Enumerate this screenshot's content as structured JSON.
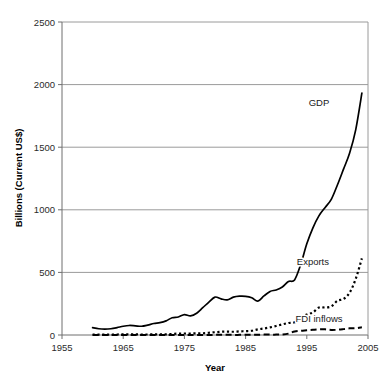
{
  "chart_data": {
    "type": "line",
    "title": "",
    "xlabel": "Year",
    "ylabel": "Billions (Current US$)",
    "xlim": [
      1955,
      2005
    ],
    "ylim": [
      0,
      2500
    ],
    "xticks": [
      "1955",
      "1965",
      "1975",
      "1985",
      "1995",
      "2005"
    ],
    "xtick_values": [
      1955,
      1965,
      1975,
      1985,
      1995,
      2005
    ],
    "yticks": [
      "0",
      "500",
      "1000",
      "1500",
      "2000",
      "2500"
    ],
    "ytick_values": [
      0,
      500,
      1000,
      1500,
      2000,
      2500
    ],
    "grid": "horizontal",
    "legend_position": "inline-annotations",
    "x": [
      1960,
      1961,
      1962,
      1963,
      1964,
      1965,
      1966,
      1967,
      1968,
      1969,
      1970,
      1971,
      1972,
      1973,
      1974,
      1975,
      1976,
      1977,
      1978,
      1979,
      1980,
      1981,
      1982,
      1983,
      1984,
      1985,
      1986,
      1987,
      1988,
      1989,
      1990,
      1991,
      1992,
      1993,
      1994,
      1995,
      1996,
      1997,
      1998,
      1999,
      2000,
      2001,
      2002,
      2003,
      2004
    ],
    "series": [
      {
        "name": "GDP",
        "style": "solid",
        "color": "#000000",
        "label_x": 1997,
        "label_y": 1830,
        "values": [
          59,
          50,
          47,
          50,
          59,
          70,
          76,
          73,
          70,
          79,
          92,
          99,
          113,
          138,
          144,
          163,
          153,
          174,
          218,
          263,
          303,
          289,
          281,
          302,
          310,
          309,
          298,
          271,
          312,
          348,
          360,
          383,
          427,
          440,
          562,
          728,
          856,
          953,
          1019,
          1083,
          1198,
          1325,
          1454,
          1641,
          1932
        ]
      },
      {
        "name": "Exports",
        "style": "dotted",
        "color": "#000000",
        "label_x": 1996,
        "label_y": 560,
        "values": [
          3,
          3,
          3,
          4,
          4,
          5,
          5,
          5,
          4,
          4,
          5,
          5,
          5,
          8,
          11,
          12,
          12,
          13,
          14,
          18,
          22,
          26,
          27,
          26,
          29,
          31,
          34,
          45,
          52,
          61,
          72,
          85,
          96,
          101,
          134,
          164,
          180,
          220,
          220,
          228,
          273,
          288,
          338,
          449,
          612
        ]
      },
      {
        "name": "FDI inflows",
        "style": "dashed",
        "color": "#000000",
        "label_x": 1997,
        "label_y": 105,
        "values": [
          0,
          0,
          0,
          0,
          0,
          0,
          0,
          0,
          0,
          0,
          0,
          0,
          0,
          0,
          0,
          0,
          0,
          0,
          0,
          0,
          1,
          1,
          1,
          1,
          1,
          2,
          2,
          2,
          3,
          3,
          3,
          4,
          11,
          28,
          34,
          38,
          42,
          45,
          45,
          40,
          42,
          47,
          53,
          54,
          61
        ]
      }
    ],
    "annotations": [
      {
        "text": "GDP",
        "x": 1997,
        "y": 1830
      },
      {
        "text": "Exports",
        "x": 1996,
        "y": 560
      },
      {
        "text": "FDI inflows",
        "x": 1997,
        "y": 105
      }
    ]
  },
  "axes": {
    "x_title": "Year",
    "y_title": "Billions (Current US$)"
  }
}
